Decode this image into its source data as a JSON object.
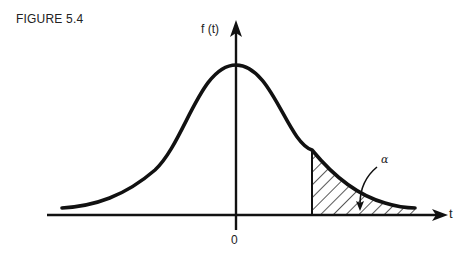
{
  "figure": {
    "label": "FIGURE 5.4",
    "y_axis_label": "f (t)",
    "x_axis_label": "t",
    "origin_label": "0",
    "tail_label": "α",
    "colors": {
      "ink": "#111111",
      "background": "#ffffff"
    }
  }
}
